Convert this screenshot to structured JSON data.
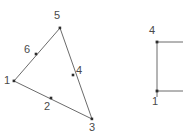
{
  "figure": {
    "kind": "geometric-mesh-diagram",
    "background_color": "#ffffff",
    "stroke_color": "#595959",
    "label_color": "#4a4a4a",
    "node_marker_color": "#333333",
    "width": 183,
    "height": 140
  },
  "triangle": {
    "name": "labeled-triangle-element",
    "vertices": [
      {
        "id": "1",
        "label": "1",
        "x": 14,
        "y": 81,
        "label_x": 4,
        "label_y": 75,
        "type": "corner"
      },
      {
        "id": "5",
        "label": "5",
        "x": 60,
        "y": 28,
        "label_x": 54,
        "label_y": 10,
        "type": "corner"
      },
      {
        "id": "3",
        "label": "3",
        "x": 92,
        "y": 119,
        "label_x": 89,
        "label_y": 122,
        "type": "corner"
      }
    ],
    "midside_nodes": [
      {
        "id": "6",
        "label": "6",
        "x": 36,
        "y": 54,
        "label_x": 24,
        "label_y": 44,
        "type": "midside",
        "on_edge": "1-5"
      },
      {
        "id": "4",
        "label": "4",
        "x": 73,
        "y": 75,
        "label_x": 76,
        "label_y": 65,
        "type": "midside",
        "on_edge": "5-3"
      },
      {
        "id": "2",
        "label": "2",
        "x": 51,
        "y": 98,
        "label_x": 44,
        "label_y": 101,
        "type": "midside",
        "on_edge": "1-3"
      }
    ],
    "edges": [
      {
        "from": "1",
        "to": "5"
      },
      {
        "from": "5",
        "to": "3"
      },
      {
        "from": "1",
        "to": "3"
      }
    ]
  },
  "right_shape": {
    "name": "clipped-rectangle-element",
    "note": "partially visible rectangular element clipped at right edge of image",
    "vertical_line": {
      "x": 157,
      "y1": 42,
      "y2": 97
    },
    "horizontal_lines": [
      {
        "x1": 157,
        "x2": 183,
        "y": 42
      },
      {
        "x1": 157,
        "x2": 183,
        "y": 91
      }
    ],
    "nodes": [
      {
        "id": "4",
        "label": "4",
        "x": 157,
        "y": 42,
        "label_x": 149,
        "label_y": 25,
        "type": "corner"
      },
      {
        "id": "1",
        "label": "1",
        "x": 157,
        "y": 91,
        "label_x": 152,
        "label_y": 96,
        "type": "corner"
      }
    ]
  }
}
